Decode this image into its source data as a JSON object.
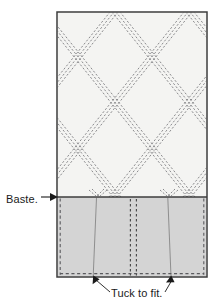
{
  "diagram": {
    "type": "sewing-instruction-diagram",
    "annotations": {
      "baste": {
        "text": "Baste.",
        "pointer": "right-arrow",
        "target": "baste-seam-line"
      },
      "tuck": {
        "text": "Tuck to fit.",
        "pointer": "two-up-arrows",
        "target": "tuck-fold-lines"
      }
    },
    "panel": {
      "x": 57,
      "y": 12,
      "width": 150,
      "height": 265,
      "border_color": "#3c3c3c",
      "border_width": 1.4
    },
    "quilted_region": {
      "name": "diamond-lattice-quilting",
      "fill": "#f4f4f2",
      "y_top": 12,
      "y_bottom": 197,
      "stitch_color": "#6e6e72",
      "line_style": "dashed",
      "lines_per_band": 3,
      "band_spacing_px": 3,
      "diamond_half_width_px": 37,
      "diamond_half_height_px": 46,
      "slope": 1.24
    },
    "hem_region": {
      "name": "basted-hem-allowance",
      "fill": "#d4d4d4",
      "y_top": 197,
      "y_bottom": 277,
      "baste_line_color": "#3c3c3c",
      "edge_dash_color": "#555558"
    },
    "tuck_folds": {
      "left_fold_x": 94,
      "right_fold_x": 170,
      "center_dash_x": [
        130,
        137
      ],
      "fold_line_color": "#8a8a8a"
    },
    "colors": {
      "paper": "#ffffff",
      "quilt_fill": "#f4f4f2",
      "hem_fill": "#d4d4d4",
      "outline": "#3c3c3c",
      "stitch": "#6e6e72",
      "text": "#1a1a1a"
    }
  }
}
